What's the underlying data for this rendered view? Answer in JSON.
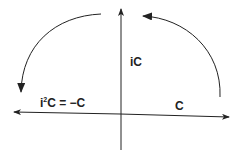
{
  "diagram": {
    "labels": {
      "c": "C",
      "ic": "iC",
      "i2c_base": "i",
      "i2c_exp": "2",
      "i2c_rest": "C = −C"
    },
    "elements": [
      "horizontal-axis",
      "vertical-axis",
      "rotation-arc-right",
      "rotation-arc-left"
    ],
    "colors": {
      "stroke": "#222222",
      "background": "#ffffff"
    }
  }
}
